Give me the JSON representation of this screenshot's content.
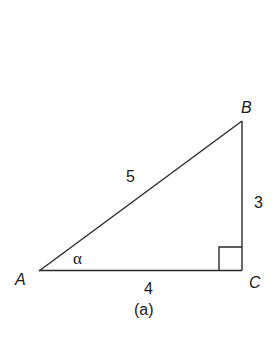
{
  "figure": {
    "caption": "(a)",
    "stroke_color": "#2a2a2a",
    "vertices": [
      {
        "name": "A",
        "x": 39,
        "y": 271
      },
      {
        "name": "B",
        "x": 242,
        "y": 121
      },
      {
        "name": "C",
        "x": 242,
        "y": 270
      }
    ],
    "sides": {
      "hypotenuse_AB": "5",
      "vertical_BC": "3",
      "base_AC": "4"
    },
    "angle_label": "α",
    "right_angle_at": "C"
  }
}
